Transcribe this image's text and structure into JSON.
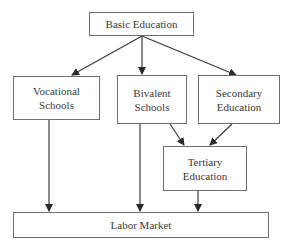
{
  "diagram": {
    "type": "flowchart",
    "nodes": {
      "basic": {
        "label": "Basic Education"
      },
      "vocational": {
        "label": "Vocational\nSchools"
      },
      "bivalent": {
        "label": "Bivalent\nSchools"
      },
      "secondary": {
        "label": "Secondary\nEducation"
      },
      "tertiary": {
        "label": "Tertiary\nEducation"
      },
      "labor": {
        "label": "Labor Market"
      }
    },
    "edges": [
      {
        "from": "Basic Education",
        "to": "Vocational Schools"
      },
      {
        "from": "Basic Education",
        "to": "Bivalent Schools"
      },
      {
        "from": "Basic Education",
        "to": "Secondary Education"
      },
      {
        "from": "Bivalent Schools",
        "to": "Tertiary Education"
      },
      {
        "from": "Secondary Education",
        "to": "Tertiary Education"
      },
      {
        "from": "Vocational Schools",
        "to": "Labor Market"
      },
      {
        "from": "Bivalent Schools",
        "to": "Labor Market"
      },
      {
        "from": "Tertiary Education",
        "to": "Labor Market"
      }
    ],
    "colors": {
      "line": "#3a3a3a",
      "border": "#6f6f6f",
      "text": "#3a3a3a"
    }
  }
}
